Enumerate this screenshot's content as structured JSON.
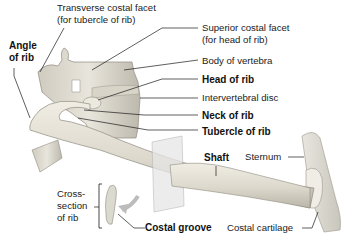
{
  "figure": {
    "colors": {
      "bone": "#e4e1d6",
      "bone_shade": "#c4c0b3",
      "bone_dark": "#9c988c",
      "cartilage": "#eceae3",
      "plane": "#dcdcdc",
      "leader": "#1a1a1a",
      "arrow": "#b9b9b9"
    },
    "labels": {
      "transverse_facet_1": "Transverse costal facet",
      "transverse_facet_2": "(for tubercle of rib)",
      "superior_facet_1": "Superior costal facet",
      "superior_facet_2": "(for head of rib)",
      "body_of_vertebra": "Body of vertebra",
      "head_of_rib": "Head of rib",
      "intervertebral_disc": "Intervertebral disc",
      "neck_of_rib": "Neck of rib",
      "tubercle_of_rib": "Tubercle of rib",
      "angle_1": "Angle",
      "angle_2": "of rib",
      "shaft": "Shaft",
      "sternum": "Sternum",
      "cross_1": "Cross-",
      "cross_2": "section",
      "cross_3": "of rib",
      "costal_groove": "Costal groove",
      "costal_cartilage": "Costal cartilage"
    }
  }
}
